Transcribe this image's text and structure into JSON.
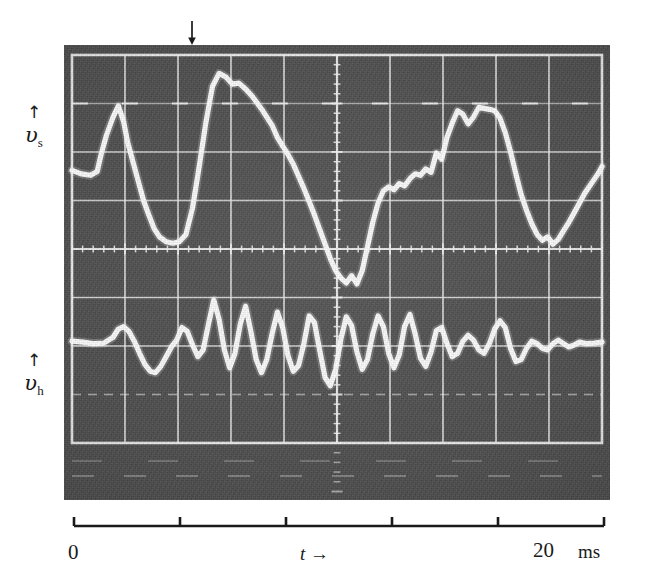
{
  "figure": {
    "type": "oscilloscope-photograph",
    "kind": "dual-trace-oscillogram",
    "background_color": "#4c4c4c",
    "trace_color": "#ffffff",
    "grid_color": "#f2f2f2",
    "ink_color": "#1a1a1a"
  },
  "y_axis": {
    "upper": {
      "arrow": "↑",
      "symbol": "υ",
      "subscript": "s",
      "name": "v_s"
    },
    "lower": {
      "arrow": "↑",
      "symbol": "υ",
      "subscript": "h",
      "name": "v_h"
    }
  },
  "markers": {
    "trigger_arrow": "↓",
    "trigger_arrow_x_px": 192
  },
  "x_axis": {
    "start_label": "0",
    "mid_label": "t",
    "mid_arrow": "→",
    "end_label": "20",
    "unit_label": "ms",
    "tick_count": 6,
    "tick_fractions": [
      0,
      0.2,
      0.4,
      0.6,
      0.8,
      1.0
    ]
  },
  "chart_data": {
    "type": "line",
    "title": "",
    "subtitle": "",
    "xlabel": "t",
    "ylabel": "",
    "xunit": "ms",
    "xlim": [
      0,
      20
    ],
    "ylim": [
      0,
      8
    ],
    "grid": true,
    "legend": "none",
    "legend_position": "left-axis-labels",
    "graticule": {
      "columns": 10,
      "rows": 8,
      "minor_ticks_per_division": 5,
      "center_axes": true
    },
    "series": [
      {
        "name": "v_s",
        "label": "υs",
        "baseline_y": 5.55,
        "x": [
          0.0,
          0.35,
          0.7,
          0.95,
          1.1,
          1.3,
          1.55,
          1.75,
          1.95,
          2.1,
          2.3,
          2.5,
          2.7,
          2.9,
          3.1,
          3.3,
          3.55,
          3.8,
          4.05,
          4.3,
          4.55,
          4.8,
          5.05,
          5.3,
          5.55,
          5.8,
          6.05,
          6.3,
          6.55,
          6.8,
          7.0,
          7.2,
          7.35,
          7.55,
          7.75,
          7.95,
          8.15,
          8.35,
          8.55,
          8.75,
          8.95,
          9.15,
          9.35,
          9.55,
          9.75,
          9.95,
          10.15,
          10.35,
          10.55,
          10.75,
          10.95,
          11.15,
          11.35,
          11.55,
          11.75,
          11.95,
          12.15,
          12.35,
          12.55,
          12.75,
          12.95,
          13.15,
          13.35,
          13.55,
          13.75,
          13.95,
          14.15,
          14.35,
          14.55,
          14.75,
          14.95,
          15.15,
          15.35,
          15.55,
          15.75,
          15.95,
          16.15,
          16.35,
          16.55,
          16.75,
          16.95,
          17.15,
          17.35,
          17.55,
          17.75,
          17.95,
          18.15,
          18.35,
          18.55,
          18.75,
          18.95,
          19.15,
          19.35,
          19.6,
          19.85,
          20.0
        ],
        "y": [
          5.62,
          5.55,
          5.52,
          5.6,
          5.95,
          6.35,
          6.72,
          6.95,
          6.62,
          6.2,
          5.8,
          5.4,
          5.0,
          4.7,
          4.42,
          4.25,
          4.15,
          4.12,
          4.15,
          4.3,
          4.85,
          5.7,
          6.6,
          7.35,
          7.62,
          7.55,
          7.4,
          7.42,
          7.3,
          7.15,
          7.0,
          6.85,
          6.72,
          6.55,
          6.3,
          6.12,
          5.95,
          5.75,
          5.5,
          5.25,
          4.98,
          4.7,
          4.4,
          4.1,
          3.8,
          3.55,
          3.4,
          3.3,
          3.45,
          3.28,
          3.55,
          4.05,
          4.55,
          4.95,
          5.2,
          5.28,
          5.22,
          5.35,
          5.3,
          5.45,
          5.55,
          5.52,
          5.65,
          5.58,
          5.98,
          5.85,
          6.3,
          6.6,
          6.85,
          6.78,
          6.58,
          6.72,
          6.92,
          6.9,
          6.88,
          6.85,
          6.7,
          6.4,
          6.0,
          5.55,
          5.12,
          4.8,
          4.52,
          4.3,
          4.18,
          4.25,
          4.1,
          4.2,
          4.38,
          4.55,
          4.75,
          4.95,
          5.15,
          5.35,
          5.55,
          5.7
        ]
      },
      {
        "name": "v_h",
        "label": "υh",
        "baseline_y": 2.05,
        "x": [
          0.0,
          0.4,
          0.8,
          1.2,
          1.55,
          1.75,
          1.95,
          2.15,
          2.35,
          2.55,
          2.75,
          2.95,
          3.15,
          3.35,
          3.55,
          3.75,
          3.95,
          4.15,
          4.35,
          4.55,
          4.75,
          4.95,
          5.15,
          5.35,
          5.55,
          5.75,
          5.95,
          6.15,
          6.35,
          6.55,
          6.75,
          6.95,
          7.15,
          7.35,
          7.55,
          7.75,
          7.95,
          8.15,
          8.35,
          8.55,
          8.75,
          8.95,
          9.15,
          9.35,
          9.55,
          9.75,
          9.95,
          10.15,
          10.35,
          10.55,
          10.75,
          10.95,
          11.15,
          11.35,
          11.55,
          11.75,
          11.95,
          12.15,
          12.35,
          12.55,
          12.75,
          12.95,
          13.15,
          13.35,
          13.55,
          13.75,
          13.95,
          14.15,
          14.35,
          14.55,
          14.75,
          14.95,
          15.15,
          15.35,
          15.55,
          15.75,
          15.95,
          16.15,
          16.35,
          16.55,
          16.75,
          16.95,
          17.15,
          17.35,
          17.55,
          17.75,
          17.95,
          18.15,
          18.35,
          18.55,
          18.75,
          18.95,
          19.15,
          19.4,
          19.7,
          20.0
        ],
        "y": [
          2.1,
          2.08,
          2.05,
          2.06,
          2.18,
          2.35,
          2.4,
          2.3,
          2.1,
          1.85,
          1.62,
          1.48,
          1.45,
          1.58,
          1.78,
          1.98,
          2.12,
          2.38,
          2.3,
          2.02,
          1.78,
          1.92,
          2.45,
          2.95,
          2.55,
          1.92,
          1.55,
          1.85,
          2.45,
          2.82,
          2.3,
          1.72,
          1.45,
          1.72,
          2.25,
          2.7,
          2.38,
          1.8,
          1.48,
          1.6,
          2.05,
          2.62,
          2.48,
          1.9,
          1.35,
          1.18,
          1.52,
          2.15,
          2.6,
          2.42,
          1.88,
          1.52,
          1.72,
          2.25,
          2.62,
          2.4,
          1.85,
          1.55,
          1.82,
          2.4,
          2.65,
          2.25,
          1.75,
          1.58,
          1.88,
          2.32,
          2.38,
          2.05,
          1.78,
          1.85,
          2.1,
          2.22,
          2.12,
          1.92,
          1.85,
          2.05,
          2.35,
          2.52,
          2.38,
          1.95,
          1.68,
          1.72,
          1.95,
          2.1,
          2.05,
          1.95,
          1.92,
          2.05,
          2.12,
          2.05,
          1.98,
          2.02,
          2.08,
          2.05,
          2.06,
          2.08
        ]
      }
    ]
  }
}
